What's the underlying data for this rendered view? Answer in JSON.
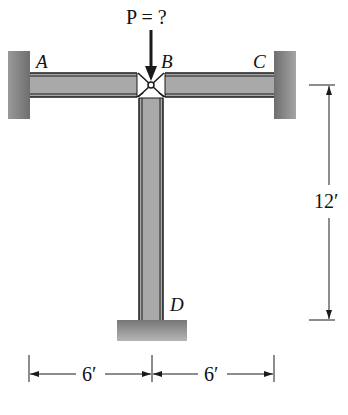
{
  "diagram": {
    "type": "structural frame",
    "load": {
      "label": "P = ?",
      "symbol": "P",
      "value": "?",
      "direction": "down",
      "at": "B"
    },
    "points": [
      {
        "id": "A",
        "label": "A",
        "support": "fixed wall (left)"
      },
      {
        "id": "B",
        "label": "B",
        "support": "pin joint"
      },
      {
        "id": "C",
        "label": "C",
        "support": "fixed wall (right)"
      },
      {
        "id": "D",
        "label": "D",
        "support": "fixed base"
      }
    ],
    "members": [
      {
        "from": "A",
        "to": "B",
        "orientation": "horizontal"
      },
      {
        "from": "B",
        "to": "C",
        "orientation": "horizontal"
      },
      {
        "from": "B",
        "to": "D",
        "orientation": "vertical"
      }
    ],
    "dimensions": {
      "left_span": "6′",
      "right_span": "6′",
      "column_height": "12′"
    },
    "colors": {
      "member_fill": "#a9a9a9",
      "support_fill": "#8c8c8c",
      "line": "#1a1a1a"
    }
  }
}
